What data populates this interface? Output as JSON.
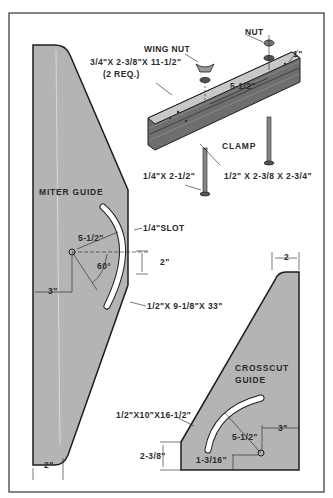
{
  "diagram": {
    "colors": {
      "panel_fill": "#b4b4b4",
      "outline": "#1e1e1e",
      "frame": "#333333",
      "background": "#ffffff",
      "slot": "#ffffff",
      "clamp_top": "#c8c8c8",
      "clamp_side": "#7a7a7a"
    },
    "clamp_assembly": {
      "wing_nut_label": "WING NUT",
      "nut_label": "NUT",
      "board_label": "3/4\"X 2-3/8\"X 11-1/2\"",
      "board_qty": "(2 REQ.)",
      "thickness_dim": "1\"",
      "bolt_spacing_dim": "5-1/2\"",
      "clamp_label": "CLAMP",
      "bolt_label": "1/4\"X 2-1/2\"",
      "block_label": "1/2\" X 2-3/8 X 2-3/4\""
    },
    "miter_guide": {
      "title": "MITER GUIDE",
      "slot_label": "1/4\"SLOT",
      "radius_dim": "5-1/2\"",
      "angle_dim": "60°",
      "vertical_dim": "2\"",
      "pivot_offset_dim": "3\"",
      "size_label": "1/2\"X 9-1/8\"X 33\"",
      "bottom_dim": "2\""
    },
    "crosscut_guide": {
      "title_line1": "CROSSCUT",
      "title_line2": "GUIDE",
      "top_dim": "2",
      "size_label": "1/2\"X10\"X16-1/2\"",
      "radius_dim": "5-1/2\"",
      "edge_offset_dim": "3\"",
      "height_dim": "2-3/8\"",
      "pivot_height_dim": "1-3/16\""
    }
  }
}
